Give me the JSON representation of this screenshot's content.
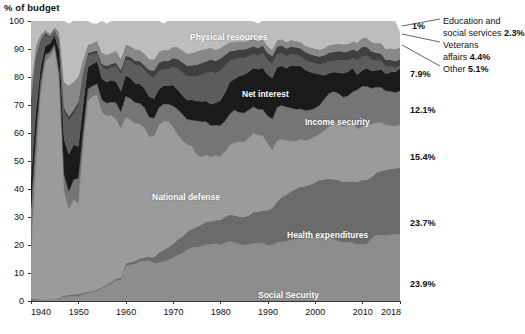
{
  "chart_data": {
    "type": "area",
    "title": "% of budget",
    "xlabel": "",
    "ylabel": "% of budget",
    "xlim": [
      1940,
      2018
    ],
    "ylim": [
      0,
      100
    ],
    "grid": false,
    "stacked": true,
    "legend_position": "in-plot and right-margin",
    "xticks": [
      "1940",
      "1950",
      "1960",
      "1970",
      "1980",
      "1990",
      "2000",
      "2010",
      "2018"
    ],
    "xtick_values": [
      1940,
      1950,
      1960,
      1970,
      1980,
      1990,
      2000,
      2010,
      2018
    ],
    "yticks": [
      "0",
      "10",
      "20",
      "30",
      "40",
      "50",
      "60",
      "70",
      "80",
      "90",
      "100"
    ],
    "ytick_values": [
      0,
      10,
      20,
      30,
      40,
      50,
      60,
      70,
      80,
      90,
      100
    ],
    "x": [
      1940,
      1941,
      1942,
      1943,
      1944,
      1945,
      1946,
      1947,
      1948,
      1949,
      1950,
      1951,
      1952,
      1953,
      1954,
      1955,
      1956,
      1957,
      1958,
      1959,
      1960,
      1961,
      1962,
      1963,
      1964,
      1965,
      1966,
      1967,
      1968,
      1969,
      1970,
      1971,
      1972,
      1973,
      1974,
      1975,
      1976,
      1977,
      1978,
      1979,
      1980,
      1981,
      1982,
      1983,
      1984,
      1985,
      1986,
      1987,
      1988,
      1989,
      1990,
      1991,
      1992,
      1993,
      1994,
      1995,
      1996,
      1997,
      1998,
      1999,
      2000,
      2001,
      2002,
      2003,
      2004,
      2005,
      2006,
      2007,
      2008,
      2009,
      2010,
      2011,
      2012,
      2013,
      2014,
      2015,
      2016,
      2017,
      2018
    ],
    "series": [
      {
        "name": "Social Security",
        "color": "#8d8d8d",
        "end_value_label": "23.9%",
        "values": [
          0.3,
          0.3,
          0.3,
          0.4,
          0.5,
          0.6,
          0.8,
          1.4,
          1.6,
          1.7,
          1.8,
          2.4,
          2.8,
          3.2,
          3.6,
          4.5,
          5.5,
          6.4,
          7.3,
          7.6,
          12.6,
          12.9,
          13.3,
          14.1,
          14.3,
          14.4,
          13.6,
          13.7,
          14.0,
          14.7,
          15.4,
          16.4,
          17.0,
          18.4,
          19.2,
          19.2,
          19.6,
          20.2,
          20.3,
          20.5,
          20.1,
          20.8,
          21.3,
          21.0,
          20.4,
          20.0,
          20.2,
          20.7,
          20.7,
          20.8,
          19.9,
          20.1,
          20.9,
          21.2,
          21.4,
          21.8,
          22.1,
          22.2,
          22.3,
          22.6,
          22.9,
          23.0,
          22.7,
          22.4,
          22.1,
          21.4,
          21.0,
          21.0,
          20.8,
          20.2,
          20.4,
          20.4,
          22.4,
          23.5,
          23.5,
          23.6,
          23.7,
          23.8,
          23.9
        ]
      },
      {
        "name": "Health expenditures",
        "color": "#6b6b6b",
        "end_value_label": "23.7%",
        "values": [
          0.5,
          0.4,
          0.2,
          0.1,
          0.1,
          0.2,
          0.4,
          0.6,
          0.6,
          0.7,
          0.7,
          0.6,
          0.5,
          0.5,
          0.5,
          0.5,
          0.5,
          0.6,
          0.7,
          0.8,
          0.9,
          1.0,
          1.1,
          1.2,
          1.3,
          1.5,
          2.0,
          3.6,
          4.2,
          4.5,
          5.0,
          5.6,
          6.0,
          6.3,
          6.6,
          7.2,
          7.7,
          8.1,
          8.2,
          8.4,
          8.8,
          9.3,
          9.6,
          9.6,
          9.8,
          10.0,
          10.3,
          11.1,
          11.2,
          11.6,
          12.5,
          13.2,
          14.6,
          15.9,
          16.6,
          17.4,
          18.0,
          18.6,
          18.8,
          19.0,
          19.4,
          20.2,
          20.8,
          21.3,
          21.4,
          21.8,
          21.6,
          21.8,
          22.0,
          22.4,
          22.8,
          22.9,
          22.0,
          22.4,
          23.0,
          23.3,
          23.5,
          23.6,
          23.7
        ]
      },
      {
        "name": "National defense",
        "color": "#9b9b9b",
        "end_value_label": "15.4%",
        "values": [
          17.5,
          47.1,
          73.0,
          84.9,
          86.7,
          89.5,
          77.3,
          37.1,
          30.6,
          33.9,
          32.2,
          51.8,
          68.1,
          69.4,
          69.5,
          62.4,
          60.2,
          59.3,
          56.8,
          53.2,
          52.2,
          50.8,
          49.0,
          48.0,
          46.2,
          42.8,
          43.2,
          45.4,
          46.0,
          44.9,
          41.8,
          37.5,
          34.3,
          31.2,
          29.5,
          26.0,
          24.1,
          23.8,
          22.8,
          23.1,
          22.7,
          23.2,
          24.8,
          26.0,
          26.7,
          26.7,
          27.6,
          28.1,
          27.3,
          26.6,
          23.9,
          20.6,
          21.6,
          20.7,
          19.3,
          17.9,
          17.0,
          16.9,
          16.2,
          16.2,
          16.5,
          16.4,
          17.3,
          18.7,
          19.9,
          20.0,
          19.7,
          20.2,
          20.7,
          18.8,
          19.1,
          19.6,
          18.7,
          17.8,
          17.3,
          15.9,
          15.5,
          15.0,
          15.4
        ]
      },
      {
        "name": "Income security",
        "color": "#757575",
        "end_value_label": "12.1%",
        "values": [
          15.2,
          11.0,
          5.0,
          2.6,
          1.6,
          1.4,
          3.3,
          6.0,
          6.4,
          7.0,
          9.1,
          6.1,
          4.3,
          3.8,
          4.0,
          4.5,
          4.5,
          4.8,
          6.0,
          6.0,
          7.4,
          7.7,
          7.5,
          7.3,
          7.2,
          7.0,
          6.5,
          6.3,
          6.2,
          6.3,
          7.5,
          9.0,
          9.5,
          9.0,
          9.3,
          12.0,
          12.7,
          12.0,
          11.4,
          10.8,
          11.1,
          11.0,
          11.1,
          11.6,
          10.5,
          10.4,
          10.1,
          9.5,
          9.3,
          9.5,
          9.9,
          11.1,
          12.0,
          12.1,
          12.0,
          11.8,
          11.4,
          11.0,
          10.7,
          10.5,
          10.0,
          10.3,
          11.3,
          11.8,
          11.4,
          11.0,
          10.5,
          10.3,
          11.2,
          14.1,
          14.4,
          13.8,
          12.9,
          12.7,
          12.5,
          12.3,
          12.2,
          12.1,
          12.1
        ]
      },
      {
        "name": "Net interest",
        "color": "#1a1a1a",
        "end_value_label": "7.9%",
        "values": [
          10.5,
          8.4,
          4.6,
          3.1,
          3.1,
          3.2,
          7.5,
          12.6,
          13.3,
          12.5,
          11.4,
          9.3,
          7.9,
          7.7,
          7.9,
          7.6,
          7.5,
          7.8,
          7.5,
          7.4,
          7.5,
          7.3,
          6.9,
          6.9,
          7.0,
          7.3,
          7.0,
          6.6,
          6.5,
          6.6,
          7.4,
          7.0,
          6.7,
          6.9,
          7.3,
          7.0,
          7.2,
          7.3,
          7.6,
          8.0,
          8.9,
          10.1,
          11.4,
          11.1,
          13.0,
          13.7,
          13.7,
          13.8,
          14.3,
          14.8,
          14.7,
          14.7,
          14.4,
          14.1,
          13.9,
          15.3,
          15.5,
          15.2,
          14.6,
          13.5,
          12.5,
          11.1,
          8.5,
          7.1,
          7.0,
          7.4,
          8.5,
          8.7,
          8.5,
          5.3,
          5.7,
          6.4,
          6.2,
          6.0,
          6.5,
          6.1,
          6.9,
          7.4,
          7.9
        ]
      },
      {
        "name": "Physical resources",
        "color": "#5c5c5c",
        "end_value_label": "1%",
        "values": [
          27.0,
          19.0,
          9.0,
          4.0,
          2.0,
          1.5,
          3.0,
          10.0,
          12.0,
          11.0,
          14.5,
          10.0,
          4.0,
          3.5,
          3.0,
          4.0,
          4.5,
          4.5,
          5.5,
          6.0,
          5.5,
          6.0,
          6.5,
          6.5,
          6.5,
          7.5,
          7.5,
          6.5,
          6.0,
          5.8,
          6.5,
          7.5,
          8.0,
          8.5,
          8.5,
          9.0,
          9.5,
          10.0,
          11.5,
          10.5,
          10.5,
          9.5,
          7.5,
          7.0,
          6.5,
          6.0,
          5.5,
          5.0,
          4.8,
          5.2,
          5.0,
          5.0,
          4.6,
          4.5,
          4.2,
          4.0,
          3.8,
          3.6,
          3.5,
          3.6,
          3.6,
          3.5,
          4.2,
          4.2,
          4.0,
          4.5,
          4.5,
          4.0,
          3.5,
          5.0,
          4.9,
          4.5,
          4.0,
          3.5,
          3.0,
          2.5,
          2.0,
          1.5,
          1.0
        ]
      },
      {
        "name": "Education and social services",
        "color": "#3f3f3f",
        "end_value_label": "2.3%",
        "values": [
          1.0,
          1.0,
          1.0,
          0.8,
          0.6,
          0.5,
          0.8,
          1.5,
          1.5,
          1.5,
          1.5,
          1.2,
          1.0,
          1.0,
          1.0,
          1.2,
          1.3,
          1.3,
          1.4,
          1.5,
          1.5,
          1.5,
          1.6,
          1.7,
          1.8,
          2.0,
          2.5,
          3.0,
          3.0,
          3.0,
          3.2,
          3.5,
          3.8,
          3.8,
          3.8,
          4.0,
          4.2,
          4.2,
          4.5,
          4.5,
          4.5,
          4.0,
          3.5,
          3.2,
          3.0,
          3.0,
          3.0,
          2.8,
          2.8,
          2.8,
          2.8,
          2.8,
          2.8,
          2.8,
          2.8,
          2.8,
          2.8,
          2.8,
          2.8,
          2.8,
          2.8,
          2.8,
          3.0,
          3.2,
          3.2,
          3.2,
          3.2,
          3.2,
          3.2,
          3.5,
          3.5,
          3.2,
          3.0,
          2.8,
          2.6,
          2.5,
          2.4,
          2.3,
          2.3
        ]
      },
      {
        "name": "Veterans affairs",
        "color": "#888888",
        "end_value_label": "4.4%",
        "values": [
          6.0,
          4.0,
          2.0,
          1.0,
          1.0,
          1.0,
          3.0,
          9.0,
          11.0,
          10.0,
          9.0,
          5.0,
          3.0,
          3.0,
          3.5,
          4.0,
          4.0,
          4.0,
          4.2,
          4.2,
          4.0,
          4.0,
          4.0,
          4.0,
          4.0,
          4.0,
          4.0,
          3.8,
          3.8,
          3.8,
          4.0,
          4.2,
          4.3,
          4.3,
          4.5,
          4.8,
          4.8,
          4.5,
          4.2,
          4.0,
          3.8,
          3.6,
          3.4,
          3.2,
          3.0,
          2.9,
          2.7,
          2.6,
          2.5,
          2.4,
          2.4,
          2.3,
          2.3,
          2.3,
          2.3,
          2.3,
          2.3,
          2.3,
          2.3,
          2.4,
          2.5,
          2.5,
          2.6,
          2.7,
          2.7,
          2.7,
          2.7,
          2.7,
          2.8,
          3.0,
          3.1,
          3.2,
          3.3,
          3.5,
          3.7,
          3.9,
          4.1,
          4.3,
          4.4
        ]
      },
      {
        "name": "Other",
        "color": "#bdbdbd",
        "end_value_label": "5.1%",
        "values": [
          22.0,
          8.8,
          4.9,
          3.1,
          4.4,
          2.1,
          3.9,
          21.8,
          22.0,
          21.7,
          19.8,
          13.6,
          8.4,
          6.9,
          6.0,
          11.3,
          11.0,
          11.3,
          10.6,
          13.3,
          8.4,
          8.8,
          10.1,
          10.3,
          11.7,
          13.5,
          13.7,
          11.1,
          9.3,
          10.4,
          9.2,
          9.3,
          10.4,
          11.6,
          11.3,
          10.8,
          10.2,
          9.9,
          9.5,
          10.2,
          9.6,
          8.5,
          7.4,
          7.3,
          7.1,
          7.3,
          6.9,
          6.2,
          6.1,
          6.3,
          8.9,
          10.2,
          6.8,
          6.4,
          7.5,
          6.7,
          9.1,
          9.4,
          10.8,
          11.4,
          9.8,
          10.2,
          9.6,
          8.6,
          8.3,
          8.0,
          8.3,
          8.1,
          7.3,
          7.7,
          6.1,
          6.0,
          7.5,
          7.8,
          7.9,
          9.9,
          9.7,
          9.9,
          5.1
        ]
      }
    ],
    "inline_labels": [
      {
        "text": "Physical resources",
        "x": 190,
        "y": 32
      },
      {
        "text": "Net interest",
        "x": 242,
        "y": 89
      },
      {
        "text": "Income security",
        "x": 305,
        "y": 117
      },
      {
        "text": "National defense",
        "x": 152,
        "y": 192
      },
      {
        "text": "Health expenditures",
        "x": 287,
        "y": 230
      },
      {
        "text": "Social Security",
        "x": 258,
        "y": 290
      }
    ],
    "right_value_labels": [
      {
        "text": "1%",
        "x": 412,
        "y": 21
      },
      {
        "text": "7.9%",
        "x": 410,
        "y": 69
      },
      {
        "text": "12.1%",
        "x": 410,
        "y": 105
      },
      {
        "text": "15.4%",
        "x": 410,
        "y": 152
      },
      {
        "text": "23.7%",
        "x": 410,
        "y": 218
      },
      {
        "text": "23.9%",
        "x": 410,
        "y": 279
      }
    ],
    "callouts": [
      {
        "lines": [
          "Education and",
          "social services 2.3%"
        ],
        "bold_tail": "2.3%",
        "x": 443,
        "y": 16
      },
      {
        "lines": [
          "Veterans",
          "affairs 4.4%"
        ],
        "bold_tail": "4.4%",
        "x": 443,
        "y": 40
      },
      {
        "lines": [
          "Other 5.1%"
        ],
        "bold_tail": "5.1%",
        "x": 443,
        "y": 64
      }
    ],
    "colors": {
      "social_security": "#8d8d8d",
      "health_expenditures": "#6b6b6b",
      "national_defense": "#9b9b9b",
      "income_security": "#757575",
      "net_interest": "#1a1a1a",
      "physical_resources": "#5c5c5c",
      "education_social_services": "#3f3f3f",
      "veterans_affairs": "#888888",
      "other": "#bdbdbd",
      "axis": "#333333",
      "background": "#ffffff",
      "inline_label_text": "#ffffff"
    }
  }
}
